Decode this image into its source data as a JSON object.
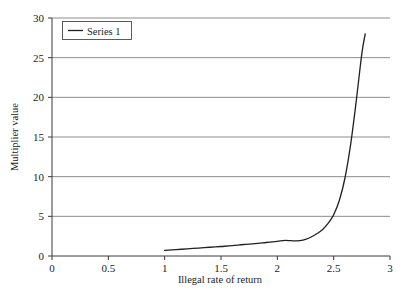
{
  "chart_data": {
    "type": "line",
    "title": "",
    "xlabel": "Illegal rate of return",
    "ylabel": "Multiplier value",
    "xlim": [
      0,
      3
    ],
    "ylim": [
      0,
      30
    ],
    "grid": true,
    "grid_axis": "y",
    "legend_position": "top-left-inside",
    "xticks": [
      "0",
      "0.5",
      "1",
      "1.5",
      "2",
      "2.5",
      "3"
    ],
    "xtick_values": [
      0,
      0.5,
      1,
      1.5,
      2,
      2.5,
      3
    ],
    "yticks": [
      "0",
      "5",
      "10",
      "15",
      "20",
      "25",
      "30"
    ],
    "ytick_values": [
      0,
      5,
      10,
      15,
      20,
      25,
      30
    ],
    "series": [
      {
        "name": "Series 1",
        "color": "#231f20",
        "x": [
          1.0,
          1.1,
          1.2,
          1.3,
          1.4,
          1.5,
          1.6,
          1.7,
          1.8,
          1.9,
          2.0,
          2.05,
          2.1,
          2.15,
          2.2,
          2.25,
          2.3,
          2.35,
          2.4,
          2.45,
          2.5,
          2.55,
          2.6,
          2.65,
          2.7,
          2.75,
          2.78
        ],
        "y": [
          0.7,
          0.8,
          0.9,
          1.0,
          1.1,
          1.2,
          1.3,
          1.45,
          1.55,
          1.7,
          1.85,
          1.95,
          1.95,
          1.9,
          1.95,
          2.1,
          2.4,
          2.8,
          3.3,
          4.1,
          5.2,
          7.0,
          9.8,
          14.0,
          19.5,
          25.5,
          28.0
        ]
      }
    ],
    "legend": [
      {
        "label": "Series 1",
        "color": "#231f20"
      }
    ]
  },
  "axes": {
    "y_axis_title": "Multiplier value",
    "x_axis_title": "Illegal rate of return"
  }
}
